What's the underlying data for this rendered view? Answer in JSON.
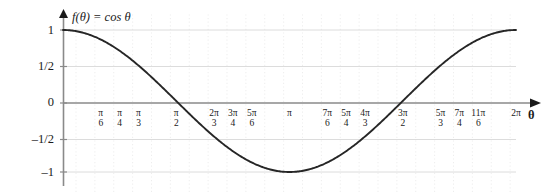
{
  "figure": {
    "background_color": "#ffffff",
    "curve_color": "#262626",
    "grid_color": "#d8d8d8",
    "axis_color": "#808080",
    "text_color": "#1a1a1a"
  },
  "axis_titles": {
    "y_expression_prefix": "f",
    "y_expression": "f(θ) = cos θ",
    "x_symbol": "θ"
  },
  "chart_data": {
    "type": "line",
    "title": "f(θ) = cos θ",
    "xlabel": "θ",
    "ylabel": "f(θ)",
    "grid": true,
    "legend": "none",
    "xlim": [
      0,
      6.283185307179586
    ],
    "ylim": [
      -1,
      1
    ],
    "x_tick_labels": [
      {
        "value": 0.5235987755982988,
        "numerator": "π",
        "denominator": "6",
        "display": "π/6"
      },
      {
        "value": 0.7853981633974483,
        "numerator": "π",
        "denominator": "4",
        "display": "π/4"
      },
      {
        "value": 1.0471975511965976,
        "numerator": "π",
        "denominator": "3",
        "display": "π/3"
      },
      {
        "value": 1.5707963267948966,
        "numerator": "π",
        "denominator": "2",
        "display": "π/2"
      },
      {
        "value": 2.0943951023931953,
        "numerator": "2π",
        "denominator": "3",
        "display": "2π/3"
      },
      {
        "value": 2.356194490192345,
        "numerator": "3π",
        "denominator": "4",
        "display": "3π/4"
      },
      {
        "value": 2.6179938779914944,
        "numerator": "5π",
        "denominator": "6",
        "display": "5π/6"
      },
      {
        "value": 3.141592653589793,
        "numerator": "π",
        "denominator": "",
        "display": "π"
      },
      {
        "value": 3.665191429188092,
        "numerator": "7π",
        "denominator": "6",
        "display": "7π/6"
      },
      {
        "value": 3.9269908169872414,
        "numerator": "5π",
        "denominator": "4",
        "display": "5π/4"
      },
      {
        "value": 4.1887902047863905,
        "numerator": "4π",
        "denominator": "3",
        "display": "4π/3"
      },
      {
        "value": 4.71238898038469,
        "numerator": "3π",
        "denominator": "2",
        "display": "3π/2"
      },
      {
        "value": 5.235987755982989,
        "numerator": "5π",
        "denominator": "3",
        "display": "5π/3"
      },
      {
        "value": 5.497787143782138,
        "numerator": "7π",
        "denominator": "4",
        "display": "7π/4"
      },
      {
        "value": 5.759586531581287,
        "numerator": "11π",
        "denominator": "6",
        "display": "11π/6"
      },
      {
        "value": 6.283185307179586,
        "numerator": "2π",
        "denominator": "",
        "display": "2π"
      }
    ],
    "y_tick_labels": [
      {
        "value": 1,
        "display": "1"
      },
      {
        "value": 0.5,
        "display": "1/2"
      },
      {
        "value": 0,
        "display": "0"
      },
      {
        "value": -0.5,
        "display": "–1/2"
      },
      {
        "value": -1,
        "display": "–1"
      }
    ],
    "series": [
      {
        "name": "cos θ",
        "color": "#262626",
        "x": [
          0,
          0.5235987755982988,
          0.7853981633974483,
          1.0471975511965976,
          1.5707963267948966,
          2.0943951023931953,
          2.356194490192345,
          2.6179938779914944,
          3.141592653589793,
          3.665191429188092,
          3.9269908169872414,
          4.1887902047863905,
          4.71238898038469,
          5.235987755982989,
          5.497787143782138,
          5.759586531581287,
          6.283185307179586
        ],
        "y": [
          1,
          0.866,
          0.7071,
          0.5,
          0,
          -0.5,
          -0.7071,
          -0.866,
          -1,
          -0.866,
          -0.7071,
          -0.5,
          0,
          0.5,
          0.7071,
          0.866,
          1
        ]
      }
    ]
  },
  "geometry": {
    "x_axis_y_px": 103,
    "y_axis_x_px": 63,
    "plot_left_px": 63,
    "plot_right_px": 516,
    "y_top_px": 30,
    "y_bottom_px": 172
  }
}
